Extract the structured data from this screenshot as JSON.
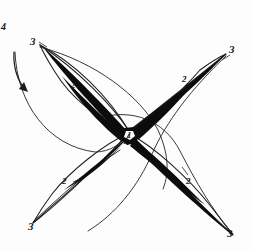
{
  "figure": {
    "ink_color": "#111111",
    "paper_color": "#fdfdfd",
    "line_color": "#1a1a1a"
  },
  "labels": [
    {
      "id": "label-4-left",
      "text": "4",
      "x": 1,
      "y": 22,
      "size": "small"
    },
    {
      "id": "label-3-top-left",
      "text": "3",
      "x": 30,
      "y": 36,
      "size": "normal"
    },
    {
      "id": "label-3-top-right",
      "text": "3",
      "x": 229,
      "y": 44,
      "size": "normal"
    },
    {
      "id": "label-3-bottom-left",
      "text": "3",
      "x": 28,
      "y": 221,
      "size": "normal"
    },
    {
      "id": "label-3-bottom-right",
      "text": "3",
      "x": 227,
      "y": 228,
      "size": "normal"
    },
    {
      "id": "label-2-upper-left",
      "text": "2",
      "x": 71,
      "y": 81,
      "size": "tiny"
    },
    {
      "id": "label-2-upper-right",
      "text": "2",
      "x": 182,
      "y": 75,
      "size": "tiny"
    },
    {
      "id": "label-2-lower-left",
      "text": "2",
      "x": 62,
      "y": 177,
      "size": "tiny"
    },
    {
      "id": "label-2-lower-right",
      "text": "2",
      "x": 186,
      "y": 177,
      "size": "tiny"
    },
    {
      "id": "label-1-center",
      "text": "1",
      "x": 127,
      "y": 131,
      "size": "tiny"
    }
  ],
  "legend_keys": {
    "one": "1",
    "two": "2",
    "three": "3",
    "four": "4"
  },
  "annotations": {
    "center_marker": "1",
    "mid_marker": "2",
    "tip_marker": "3",
    "arrow_marker": "4"
  }
}
